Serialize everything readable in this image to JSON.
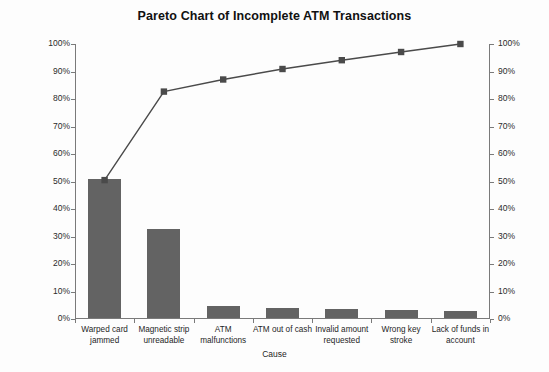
{
  "chart_data": {
    "type": "bar",
    "title": "Pareto Chart of Incomplete ATM Transactions",
    "xlabel": "Cause",
    "ylabel": "",
    "ylim": [
      0,
      100
    ],
    "y2lim": [
      0,
      100
    ],
    "grid": false,
    "legend": "none",
    "categories": [
      "Warped card jammed",
      "Magnetic strip unreadable",
      "ATM malfunctions",
      "ATM out of cash",
      "Invalid amount requested",
      "Wrong key stroke",
      "Lack of funds in account"
    ],
    "values": [
      50.5,
      32.2,
      4.4,
      3.8,
      3.2,
      3.0,
      2.5
    ],
    "cumulative": [
      50.5,
      82.7,
      87.1,
      90.9,
      94.1,
      97.1,
      100.0
    ],
    "series": [
      {
        "name": "Percent of incomplete transactions",
        "type": "bar",
        "values": [
          50.5,
          32.2,
          4.4,
          3.8,
          3.2,
          3.0,
          2.5
        ]
      },
      {
        "name": "Cumulative percent",
        "type": "line",
        "values": [
          50.5,
          82.7,
          87.1,
          90.9,
          94.1,
          97.1,
          100.0
        ]
      }
    ],
    "y_ticks": [
      "0%",
      "10%",
      "20%",
      "30%",
      "40%",
      "50%",
      "60%",
      "70%",
      "80%",
      "90%",
      "100%"
    ],
    "y2_ticks": [
      "0%",
      "10%",
      "20%",
      "30%",
      "40%",
      "50%",
      "60%",
      "70%",
      "80%",
      "90%",
      "100%"
    ],
    "colors": {
      "bar": "#636363",
      "line": "#4a4a4a",
      "marker": "#4a4a4a",
      "axis": "#7a7a7a",
      "background": "#fdfdfd",
      "text": "#1a1a1a"
    }
  }
}
